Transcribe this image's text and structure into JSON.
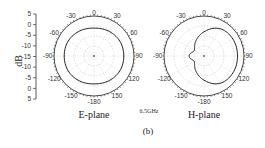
{
  "chart_data": {
    "type": "polar",
    "figure_label": "(b)",
    "frequency_label": "6.5GHz",
    "radial_axis": {
      "label": "dB",
      "ticks": [
        "5",
        "0",
        "-5",
        "-10",
        "-15",
        "-10",
        "-5",
        "0",
        "5"
      ],
      "range": [
        -15,
        5
      ]
    },
    "angular_ticks": [
      0,
      30,
      60,
      90,
      120,
      150,
      180,
      -150,
      -120,
      -90,
      -60,
      -30
    ],
    "angular_tick_labels": [
      "0",
      "30",
      "60",
      "90",
      "120",
      "150",
      "-180",
      "-150",
      "-120",
      "-90",
      "-60",
      "-30"
    ],
    "grid": true,
    "plots": [
      {
        "name": "E-plane",
        "title": "E-plane",
        "series_color": "#222222",
        "theta_deg": [
          0,
          30,
          60,
          90,
          120,
          150,
          180,
          -150,
          -120,
          -90,
          -60,
          -30
        ],
        "gain_db": [
          0,
          0.5,
          1,
          1,
          1,
          0.5,
          0,
          0.5,
          1,
          1,
          1,
          0.5
        ]
      },
      {
        "name": "H-plane",
        "title": "H-plane",
        "series_color": "#222222",
        "theta_deg": [
          0,
          30,
          60,
          90,
          120,
          150,
          180,
          -150,
          -120,
          -90,
          -60,
          -30
        ],
        "gain_db": [
          -2,
          2,
          3,
          3,
          3,
          2,
          -2,
          -6,
          -9,
          -7,
          -9,
          -6
        ]
      }
    ]
  }
}
